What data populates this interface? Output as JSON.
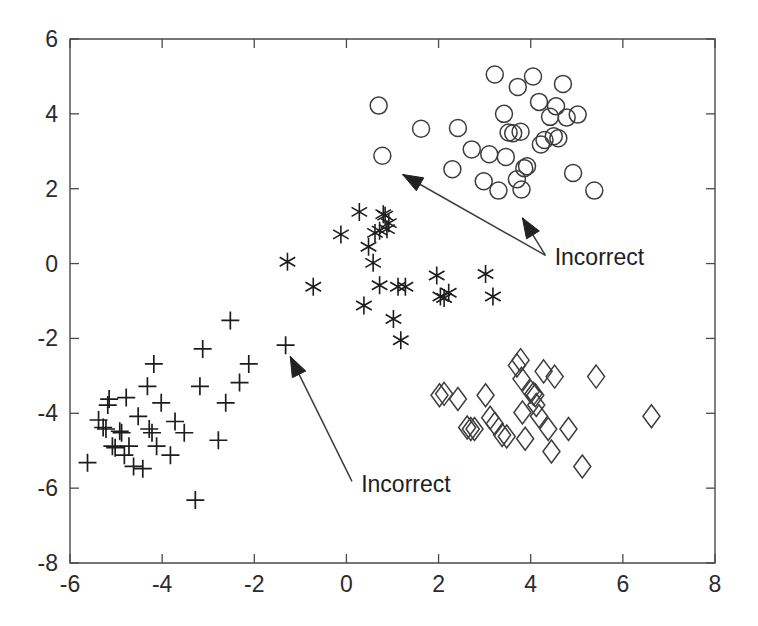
{
  "chart_data": {
    "type": "scatter",
    "title": "",
    "xlabel": "",
    "ylabel": "",
    "xlim": [
      -6,
      8
    ],
    "ylim": [
      -8,
      6
    ],
    "xticks": [
      -6,
      -4,
      -2,
      0,
      2,
      4,
      6,
      8
    ],
    "yticks": [
      -8,
      -6,
      -4,
      -2,
      0,
      2,
      4,
      6
    ],
    "xtick_labels": [
      "-6",
      "-4",
      "-2",
      "0",
      "2",
      "4",
      "6",
      "8"
    ],
    "ytick_labels": [
      "-8",
      "-6",
      "-4",
      "-2",
      "0",
      "2",
      "4",
      "6"
    ],
    "grid": false,
    "legend": null,
    "series": [
      {
        "name": "circle-cluster",
        "marker": "circle",
        "color": "#3d3d3d",
        "points": [
          [
            0.7,
            4.22
          ],
          [
            1.62,
            3.6
          ],
          [
            2.3,
            2.52
          ],
          [
            2.42,
            3.62
          ],
          [
            2.72,
            3.05
          ],
          [
            2.98,
            2.2
          ],
          [
            3.1,
            2.92
          ],
          [
            3.22,
            5.05
          ],
          [
            3.3,
            1.95
          ],
          [
            3.42,
            4.0
          ],
          [
            3.46,
            2.85
          ],
          [
            3.52,
            3.5
          ],
          [
            3.62,
            3.48
          ],
          [
            3.7,
            2.25
          ],
          [
            3.72,
            4.72
          ],
          [
            3.78,
            3.52
          ],
          [
            3.8,
            1.98
          ],
          [
            3.86,
            2.55
          ],
          [
            3.92,
            2.6
          ],
          [
            4.05,
            5.0
          ],
          [
            4.18,
            4.32
          ],
          [
            4.22,
            3.18
          ],
          [
            4.3,
            3.3
          ],
          [
            4.42,
            3.92
          ],
          [
            4.5,
            3.4
          ],
          [
            4.55,
            4.2
          ],
          [
            4.6,
            3.35
          ],
          [
            4.7,
            4.8
          ],
          [
            4.78,
            3.9
          ],
          [
            4.92,
            2.42
          ],
          [
            5.02,
            3.98
          ],
          [
            5.38,
            1.95
          ],
          [
            0.78,
            2.88
          ]
        ]
      },
      {
        "name": "star-cluster",
        "marker": "star",
        "color": "#1c1c1c",
        "points": [
          [
            -1.28,
            0.05
          ],
          [
            -0.72,
            -0.62
          ],
          [
            -0.12,
            0.78
          ],
          [
            0.28,
            1.38
          ],
          [
            0.48,
            0.45
          ],
          [
            0.58,
            0.02
          ],
          [
            0.62,
            0.82
          ],
          [
            0.72,
            0.88
          ],
          [
            0.8,
            1.32
          ],
          [
            0.84,
            1.28
          ],
          [
            0.88,
            0.92
          ],
          [
            0.92,
            1.08
          ],
          [
            0.72,
            -0.58
          ],
          [
            0.38,
            -1.12
          ],
          [
            1.12,
            -0.62
          ],
          [
            1.28,
            -0.62
          ],
          [
            1.02,
            -1.48
          ],
          [
            1.18,
            -2.05
          ],
          [
            1.96,
            -0.32
          ],
          [
            2.04,
            -0.88
          ],
          [
            2.12,
            -0.92
          ],
          [
            2.22,
            -0.78
          ],
          [
            3.02,
            -0.28
          ],
          [
            3.18,
            -0.88
          ]
        ]
      },
      {
        "name": "plus-cluster",
        "marker": "plus",
        "color": "#1c1c1c",
        "points": [
          [
            -5.62,
            -5.32
          ],
          [
            -5.38,
            -4.18
          ],
          [
            -5.28,
            -4.38
          ],
          [
            -5.22,
            -4.42
          ],
          [
            -5.18,
            -3.78
          ],
          [
            -5.15,
            -3.62
          ],
          [
            -5.08,
            -4.88
          ],
          [
            -5.02,
            -4.92
          ],
          [
            -4.92,
            -4.48
          ],
          [
            -4.88,
            -4.52
          ],
          [
            -4.82,
            -5.12
          ],
          [
            -4.78,
            -3.58
          ],
          [
            -4.72,
            -4.88
          ],
          [
            -4.62,
            -5.42
          ],
          [
            -4.52,
            -4.08
          ],
          [
            -4.42,
            -5.48
          ],
          [
            -4.32,
            -3.28
          ],
          [
            -4.28,
            -4.42
          ],
          [
            -4.22,
            -4.52
          ],
          [
            -4.18,
            -2.68
          ],
          [
            -4.12,
            -4.88
          ],
          [
            -4.02,
            -3.72
          ],
          [
            -3.82,
            -5.12
          ],
          [
            -3.72,
            -4.22
          ],
          [
            -3.52,
            -4.52
          ],
          [
            -3.28,
            -6.32
          ],
          [
            -3.18,
            -3.28
          ],
          [
            -3.12,
            -2.28
          ],
          [
            -2.78,
            -4.72
          ],
          [
            -2.62,
            -3.72
          ],
          [
            -2.52,
            -1.52
          ],
          [
            -2.32,
            -3.18
          ],
          [
            -2.12,
            -2.68
          ],
          [
            -1.32,
            -2.18
          ]
        ]
      },
      {
        "name": "diamond-cluster",
        "marker": "diamond",
        "color": "#3d3d3d",
        "points": [
          [
            2.02,
            -3.52
          ],
          [
            2.12,
            -3.48
          ],
          [
            2.42,
            -3.62
          ],
          [
            2.62,
            -4.38
          ],
          [
            2.7,
            -4.42
          ],
          [
            2.78,
            -4.42
          ],
          [
            3.02,
            -3.52
          ],
          [
            3.12,
            -4.12
          ],
          [
            3.22,
            -4.28
          ],
          [
            3.38,
            -4.58
          ],
          [
            3.48,
            -4.62
          ],
          [
            3.7,
            -2.72
          ],
          [
            3.78,
            -2.58
          ],
          [
            3.8,
            -3.08
          ],
          [
            3.82,
            -3.98
          ],
          [
            3.88,
            -4.68
          ],
          [
            4.0,
            -3.42
          ],
          [
            4.06,
            -3.48
          ],
          [
            4.1,
            -3.52
          ],
          [
            4.12,
            -3.78
          ],
          [
            4.18,
            -4.08
          ],
          [
            4.28,
            -2.88
          ],
          [
            4.38,
            -4.42
          ],
          [
            4.45,
            -5.02
          ],
          [
            4.52,
            -3.02
          ],
          [
            4.82,
            -4.42
          ],
          [
            5.12,
            -5.42
          ],
          [
            5.42,
            -3.02
          ],
          [
            6.62,
            -4.08
          ]
        ]
      }
    ],
    "annotations": [
      {
        "name": "incorrect-upper",
        "text": "Incorrect",
        "text_x": 4.52,
        "text_y": -0.05,
        "arrows": [
          {
            "from_x": 4.32,
            "from_y": 0.22,
            "to_x": 1.22,
            "to_y": 2.38
          },
          {
            "from_x": 4.32,
            "from_y": 0.22,
            "to_x": 3.82,
            "to_y": 1.22
          }
        ]
      },
      {
        "name": "incorrect-lower",
        "text": "Incorrect",
        "text_x": 0.32,
        "text_y": -6.1,
        "arrows": [
          {
            "from_x": 0.12,
            "from_y": -5.82,
            "to_x": -1.22,
            "to_y": -2.48
          }
        ]
      }
    ]
  },
  "axes": {
    "pixel_left": 70,
    "pixel_right": 715,
    "pixel_top": 39,
    "pixel_bottom": 563
  }
}
